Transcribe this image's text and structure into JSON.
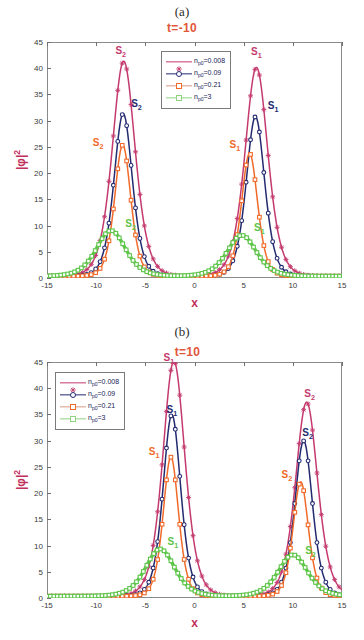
{
  "figure": {
    "width": 364,
    "height": 640,
    "background": "#ffffff"
  },
  "colors": {
    "series_1": "#c43a6e",
    "series_2": "#232a70",
    "series_3": "#f06a2a",
    "series_3_legend": "#d79a86",
    "series_4": "#5ec54a",
    "series_4_legend": "#8fd37f",
    "axis": "#8a8a8a",
    "tick_text": "#3a3a3a",
    "axis_label": "#c0305c",
    "title": "#e2563a",
    "panel_letter": "#2b2b2b",
    "legend_text": "#1a1a56",
    "annot_1": "#c43a6e",
    "annot_2": "#232a70",
    "annot_3": "#f06a2a",
    "annot_4": "#5ec54a"
  },
  "legend_labels": {
    "n_symbol": "n",
    "n_subscript": "p0",
    "v1": "=0.008",
    "v2": "=0.09",
    "v3": "=0.21",
    "v4": "=3"
  },
  "axis": {
    "ylabel_bar": "|",
    "ylabel_phi": "φ",
    "ylabel_bar2": "|",
    "ylabel_exp": "2",
    "xlabel": "x",
    "xticks": [
      -15,
      -10,
      -5,
      0,
      5,
      10,
      15
    ],
    "yticks": [
      0,
      5,
      10,
      15,
      20,
      25,
      30,
      35,
      40,
      45
    ],
    "xlim": [
      -15,
      15
    ],
    "ylim": [
      0,
      45
    ]
  },
  "panels": [
    {
      "letter": "(a)",
      "title": "t=-10",
      "legend_position": "top-center-right",
      "annotations": [
        {
          "text": "S",
          "sub": "2",
          "x": -7.5,
          "y": 43.0,
          "color": "#c43a6e"
        },
        {
          "text": "S",
          "sub": "2",
          "x": -5.9,
          "y": 33.0,
          "color": "#232a70"
        },
        {
          "text": "S",
          "sub": "2",
          "x": -9.8,
          "y": 25.6,
          "color": "#f06a2a"
        },
        {
          "text": "S",
          "sub": "2",
          "x": -6.5,
          "y": 10.2,
          "color": "#5ec54a"
        },
        {
          "text": "S",
          "sub": "1",
          "x": 6.3,
          "y": 42.9,
          "color": "#c43a6e"
        },
        {
          "text": "S",
          "sub": "1",
          "x": 8.0,
          "y": 32.7,
          "color": "#232a70"
        },
        {
          "text": "S",
          "sub": "1",
          "x": 4.1,
          "y": 25.2,
          "color": "#f06a2a"
        },
        {
          "text": "S",
          "sub": "1",
          "x": 6.6,
          "y": 9.4,
          "color": "#5ec54a"
        }
      ]
    },
    {
      "letter": "(b)",
      "title": "t=10",
      "legend_position": "top-left",
      "annotations": [
        {
          "text": "S",
          "sub": "1",
          "x": -2.6,
          "y": 45.5,
          "color": "#c43a6e"
        },
        {
          "text": "S",
          "sub": "1",
          "x": -2.3,
          "y": 35.6,
          "color": "#232a70"
        },
        {
          "text": "S",
          "sub": "1",
          "x": -4.1,
          "y": 27.6,
          "color": "#f06a2a"
        },
        {
          "text": "S",
          "sub": "1",
          "x": -2.2,
          "y": 10.4,
          "color": "#5ec54a"
        },
        {
          "text": "S",
          "sub": "2",
          "x": 11.7,
          "y": 38.8,
          "color": "#c43a6e"
        },
        {
          "text": "S",
          "sub": "2",
          "x": 11.5,
          "y": 31.2,
          "color": "#232a70"
        },
        {
          "text": "S",
          "sub": "2",
          "x": 9.4,
          "y": 23.2,
          "color": "#f06a2a"
        },
        {
          "text": "S",
          "sub": "2",
          "x": 11.8,
          "y": 8.7,
          "color": "#5ec54a"
        }
      ]
    }
  ],
  "chart_data": [
    {
      "type": "line",
      "title": "t=-10",
      "panel": "(a)",
      "xlabel": "x",
      "ylabel": "|φ|^2",
      "xlim": [
        -15,
        15
      ],
      "ylim": [
        0,
        45
      ],
      "grid": false,
      "legend_position": "upper center",
      "series": [
        {
          "name": "n_p0=0.008",
          "color": "#c43a6e",
          "marker": "star",
          "peaks": [
            {
              "label": "S2",
              "center": -7.2,
              "height": 41.0,
              "width": 1.55
            },
            {
              "label": "S1",
              "center": 6.3,
              "height": 39.8,
              "width": 1.55
            }
          ]
        },
        {
          "name": "n_p0=0.09",
          "color": "#232a70",
          "marker": "circle",
          "peaks": [
            {
              "label": "S2",
              "center": -7.25,
              "height": 31.0,
              "width": 1.25
            },
            {
              "label": "S1",
              "center": 6.2,
              "height": 30.4,
              "width": 1.25
            }
          ]
        },
        {
          "name": "n_p0=0.21",
          "color": "#f06a2a",
          "marker": "square",
          "peaks": [
            {
              "label": "S2",
              "center": -7.3,
              "height": 25.0,
              "width": 1.1
            },
            {
              "label": "S1",
              "center": 5.6,
              "height": 23.4,
              "width": 1.1
            }
          ]
        },
        {
          "name": "n_p0=3",
          "color": "#5ec54a",
          "marker": "square",
          "peaks": [
            {
              "label": "S2",
              "center": -8.5,
              "height": 8.7,
              "width": 2.0
            },
            {
              "label": "S1",
              "center": 4.8,
              "height": 7.8,
              "width": 2.0
            }
          ]
        }
      ]
    },
    {
      "type": "line",
      "title": "t=10",
      "panel": "(b)",
      "xlabel": "x",
      "ylabel": "|φ|^2",
      "xlim": [
        -15,
        15
      ],
      "ylim": [
        0,
        45
      ],
      "grid": false,
      "legend_position": "upper left",
      "series": [
        {
          "name": "n_p0=0.008",
          "color": "#c43a6e",
          "marker": "star",
          "peaks": [
            {
              "label": "S1",
              "center": -2.1,
              "height": 44.8,
              "width": 1.5
            },
            {
              "label": "S2",
              "center": 11.4,
              "height": 37.0,
              "width": 1.5
            }
          ]
        },
        {
          "name": "n_p0=0.09",
          "color": "#232a70",
          "marker": "circle",
          "peaks": [
            {
              "label": "S1",
              "center": -2.3,
              "height": 34.6,
              "width": 1.2
            },
            {
              "label": "S2",
              "center": 11.1,
              "height": 29.6,
              "width": 1.2
            }
          ]
        },
        {
          "name": "n_p0=0.21",
          "color": "#f06a2a",
          "marker": "square",
          "peaks": [
            {
              "label": "S1",
              "center": -2.4,
              "height": 26.5,
              "width": 1.05
            },
            {
              "label": "S2",
              "center": 10.8,
              "height": 21.8,
              "width": 1.05
            }
          ]
        },
        {
          "name": "n_p0=3",
          "color": "#5ec54a",
          "marker": "square",
          "peaks": [
            {
              "label": "S1",
              "center": -3.5,
              "height": 9.0,
              "width": 2.0
            },
            {
              "label": "S2",
              "center": 10.0,
              "height": 7.9,
              "width": 2.0
            }
          ]
        }
      ]
    }
  ]
}
